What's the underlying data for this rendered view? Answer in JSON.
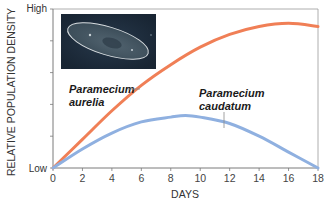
{
  "chart_data": {
    "type": "line",
    "title": "",
    "xlabel": "DAYS",
    "ylabel": "RELATIVE POPULATION DENSITY",
    "xlim": [
      0,
      18
    ],
    "ylim": [
      0,
      1
    ],
    "x_ticks": [
      0,
      2,
      4,
      6,
      8,
      10,
      12,
      14,
      16,
      18
    ],
    "y_tick_labels": {
      "low": "Low",
      "high": "High"
    },
    "y_minor_ticks": 4,
    "grid": false,
    "legend": "inline labels",
    "series": [
      {
        "name": "Paramecium aurelia",
        "label_line1": "Paramecium",
        "label_line2": "aurelia",
        "color": "#f07f56",
        "x": [
          0,
          2,
          4,
          6,
          8,
          10,
          12,
          14,
          16,
          18
        ],
        "values": [
          0,
          0.18,
          0.36,
          0.52,
          0.65,
          0.76,
          0.84,
          0.89,
          0.91,
          0.89
        ]
      },
      {
        "name": "Paramecium caudatum",
        "label_line1": "Paramecium",
        "label_line2": "caudatum",
        "color": "#8fb0e0",
        "x": [
          0,
          2,
          4,
          6,
          8,
          9,
          10,
          12,
          14,
          16,
          18
        ],
        "values": [
          0,
          0.12,
          0.22,
          0.29,
          0.32,
          0.33,
          0.32,
          0.28,
          0.2,
          0.1,
          0.0
        ]
      }
    ],
    "annotations": [
      "Inset photo: paramecium micrograph"
    ]
  },
  "colors": {
    "axis": "#7a7a7a",
    "photo_bg": "#1c2a3a"
  }
}
